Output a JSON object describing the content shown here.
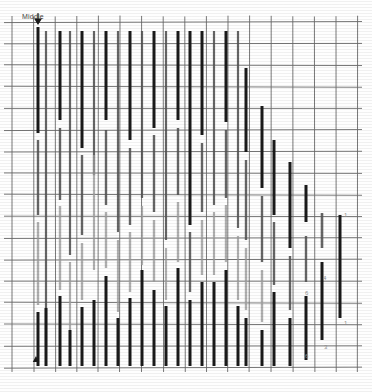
{
  "figure": {
    "title_label": "Middle",
    "arrow_icon": "down-arrow-marker",
    "bottom_marker_icon": "up-triangle-marker",
    "background": "#fefefe",
    "grid_color": "#6e6e6e",
    "grid_minor_color": "#8f8f8f",
    "bar_dark_color": "#1a1a1a",
    "bar_mid_color": "#555555",
    "bar_light_color": "#9a9a9a"
  },
  "chart_data": {
    "type": "bar",
    "title": "Middle",
    "xlabel": "",
    "ylabel": "",
    "grid": true,
    "legend": "none",
    "xlim": [
      0,
      16
    ],
    "ylim": [
      0,
      16
    ],
    "grid_cols": 16,
    "grid_rows": 16,
    "plot_box": {
      "x": 12,
      "y": 22,
      "w": 346,
      "h": 346
    },
    "cell_w": 21.6,
    "cell_h": 21.6,
    "annotations": [
      {
        "text": "Middle",
        "x": 24,
        "y": 18
      },
      {
        "text": "1",
        "x": 344,
        "y": 212
      },
      {
        "text": "4",
        "x": 323,
        "y": 275
      },
      {
        "text": "6",
        "x": 305,
        "y": 290
      },
      {
        "text": "1",
        "x": 344,
        "y": 320
      },
      {
        "text": "3",
        "x": 324,
        "y": 344
      },
      {
        "text": "6",
        "x": 305,
        "y": 353
      }
    ],
    "markers": [
      {
        "icon": "down-arrow-marker",
        "x": 38,
        "y": 20
      },
      {
        "icon": "up-triangle-marker",
        "x": 36,
        "y": 356
      }
    ],
    "series": [
      {
        "name": "dark",
        "color": "#1a1a1a"
      },
      {
        "name": "mid",
        "color": "#555555"
      },
      {
        "name": "light",
        "color": "#9a9a9a"
      }
    ],
    "bars": [
      {
        "x": 38,
        "y0": 27,
        "y1": 133,
        "w": 3.0,
        "tone": "dark"
      },
      {
        "x": 38,
        "y0": 140,
        "y1": 215,
        "w": 2.4,
        "tone": "mid"
      },
      {
        "x": 38,
        "y0": 222,
        "y1": 305,
        "w": 2.4,
        "tone": "light"
      },
      {
        "x": 38,
        "y0": 312,
        "y1": 366,
        "w": 3.0,
        "tone": "dark"
      },
      {
        "x": 46,
        "y0": 31,
        "y1": 346,
        "w": 2.2,
        "tone": "mid"
      },
      {
        "x": 46,
        "y0": 308,
        "y1": 366,
        "w": 3.0,
        "tone": "dark"
      },
      {
        "x": 60,
        "y0": 31,
        "y1": 120,
        "w": 3.0,
        "tone": "dark"
      },
      {
        "x": 60,
        "y0": 128,
        "y1": 200,
        "w": 2.4,
        "tone": "mid"
      },
      {
        "x": 60,
        "y0": 206,
        "y1": 290,
        "w": 2.4,
        "tone": "light"
      },
      {
        "x": 60,
        "y0": 296,
        "y1": 366,
        "w": 3.0,
        "tone": "dark"
      },
      {
        "x": 70,
        "y0": 31,
        "y1": 255,
        "w": 2.2,
        "tone": "mid"
      },
      {
        "x": 70,
        "y0": 262,
        "y1": 330,
        "w": 2.2,
        "tone": "light"
      },
      {
        "x": 70,
        "y0": 330,
        "y1": 366,
        "w": 3.0,
        "tone": "dark"
      },
      {
        "x": 82,
        "y0": 31,
        "y1": 148,
        "w": 3.0,
        "tone": "dark"
      },
      {
        "x": 82,
        "y0": 155,
        "y1": 235,
        "w": 2.4,
        "tone": "mid"
      },
      {
        "x": 82,
        "y0": 243,
        "y1": 300,
        "w": 2.4,
        "tone": "light"
      },
      {
        "x": 82,
        "y0": 307,
        "y1": 366,
        "w": 3.0,
        "tone": "dark"
      },
      {
        "x": 94,
        "y0": 31,
        "y1": 175,
        "w": 2.2,
        "tone": "mid"
      },
      {
        "x": 94,
        "y0": 155,
        "y1": 270,
        "w": 2.2,
        "tone": "light"
      },
      {
        "x": 94,
        "y0": 300,
        "y1": 366,
        "w": 3.0,
        "tone": "dark"
      },
      {
        "x": 106,
        "y0": 31,
        "y1": 120,
        "w": 3.0,
        "tone": "dark"
      },
      {
        "x": 106,
        "y0": 130,
        "y1": 205,
        "w": 2.4,
        "tone": "mid"
      },
      {
        "x": 106,
        "y0": 212,
        "y1": 268,
        "w": 2.4,
        "tone": "light"
      },
      {
        "x": 106,
        "y0": 276,
        "y1": 366,
        "w": 3.0,
        "tone": "dark"
      },
      {
        "x": 118,
        "y0": 31,
        "y1": 232,
        "w": 2.2,
        "tone": "mid"
      },
      {
        "x": 118,
        "y0": 240,
        "y1": 312,
        "w": 2.2,
        "tone": "light"
      },
      {
        "x": 118,
        "y0": 318,
        "y1": 366,
        "w": 3.0,
        "tone": "dark"
      },
      {
        "x": 130,
        "y0": 31,
        "y1": 140,
        "w": 3.0,
        "tone": "dark"
      },
      {
        "x": 130,
        "y0": 148,
        "y1": 225,
        "w": 2.4,
        "tone": "mid"
      },
      {
        "x": 130,
        "y0": 232,
        "y1": 292,
        "w": 2.4,
        "tone": "light"
      },
      {
        "x": 130,
        "y0": 298,
        "y1": 366,
        "w": 3.0,
        "tone": "dark"
      },
      {
        "x": 142,
        "y0": 31,
        "y1": 198,
        "w": 2.2,
        "tone": "mid"
      },
      {
        "x": 142,
        "y0": 206,
        "y1": 265,
        "w": 2.2,
        "tone": "light"
      },
      {
        "x": 142,
        "y0": 270,
        "y1": 366,
        "w": 3.0,
        "tone": "dark"
      },
      {
        "x": 154,
        "y0": 31,
        "y1": 128,
        "w": 3.0,
        "tone": "dark"
      },
      {
        "x": 154,
        "y0": 135,
        "y1": 212,
        "w": 2.4,
        "tone": "mid"
      },
      {
        "x": 154,
        "y0": 220,
        "y1": 282,
        "w": 2.4,
        "tone": "light"
      },
      {
        "x": 154,
        "y0": 290,
        "y1": 366,
        "w": 3.0,
        "tone": "dark"
      },
      {
        "x": 166,
        "y0": 31,
        "y1": 240,
        "w": 2.2,
        "tone": "mid"
      },
      {
        "x": 166,
        "y0": 248,
        "y1": 300,
        "w": 2.2,
        "tone": "light"
      },
      {
        "x": 166,
        "y0": 306,
        "y1": 366,
        "w": 3.0,
        "tone": "dark"
      },
      {
        "x": 178,
        "y0": 31,
        "y1": 120,
        "w": 3.0,
        "tone": "dark"
      },
      {
        "x": 178,
        "y0": 128,
        "y1": 195,
        "w": 2.4,
        "tone": "mid"
      },
      {
        "x": 178,
        "y0": 202,
        "y1": 262,
        "w": 2.4,
        "tone": "light"
      },
      {
        "x": 178,
        "y0": 268,
        "y1": 366,
        "w": 3.0,
        "tone": "dark"
      },
      {
        "x": 190,
        "y0": 31,
        "y1": 225,
        "w": 3.0,
        "tone": "dark"
      },
      {
        "x": 190,
        "y0": 232,
        "y1": 292,
        "w": 2.4,
        "tone": "mid"
      },
      {
        "x": 190,
        "y0": 300,
        "y1": 366,
        "w": 3.0,
        "tone": "dark"
      },
      {
        "x": 202,
        "y0": 31,
        "y1": 135,
        "w": 3.0,
        "tone": "dark"
      },
      {
        "x": 202,
        "y0": 143,
        "y1": 212,
        "w": 2.4,
        "tone": "mid"
      },
      {
        "x": 202,
        "y0": 220,
        "y1": 275,
        "w": 2.4,
        "tone": "light"
      },
      {
        "x": 202,
        "y0": 282,
        "y1": 366,
        "w": 3.0,
        "tone": "dark"
      },
      {
        "x": 214,
        "y0": 31,
        "y1": 205,
        "w": 2.2,
        "tone": "mid"
      },
      {
        "x": 214,
        "y0": 212,
        "y1": 275,
        "w": 2.2,
        "tone": "light"
      },
      {
        "x": 214,
        "y0": 282,
        "y1": 366,
        "w": 3.0,
        "tone": "dark"
      },
      {
        "x": 226,
        "y0": 31,
        "y1": 122,
        "w": 3.0,
        "tone": "dark"
      },
      {
        "x": 226,
        "y0": 130,
        "y1": 198,
        "w": 2.4,
        "tone": "mid"
      },
      {
        "x": 226,
        "y0": 205,
        "y1": 262,
        "w": 2.4,
        "tone": "light"
      },
      {
        "x": 226,
        "y0": 270,
        "y1": 366,
        "w": 3.0,
        "tone": "dark"
      },
      {
        "x": 238,
        "y0": 31,
        "y1": 228,
        "w": 2.2,
        "tone": "mid"
      },
      {
        "x": 238,
        "y0": 236,
        "y1": 300,
        "w": 2.2,
        "tone": "light"
      },
      {
        "x": 238,
        "y0": 306,
        "y1": 366,
        "w": 3.0,
        "tone": "dark"
      },
      {
        "x": 246,
        "y0": 68,
        "y1": 152,
        "w": 3.0,
        "tone": "dark"
      },
      {
        "x": 246,
        "y0": 160,
        "y1": 240,
        "w": 2.4,
        "tone": "mid"
      },
      {
        "x": 246,
        "y0": 248,
        "y1": 310,
        "w": 2.4,
        "tone": "light"
      },
      {
        "x": 246,
        "y0": 318,
        "y1": 366,
        "w": 3.0,
        "tone": "dark"
      },
      {
        "x": 262,
        "y0": 106,
        "y1": 188,
        "w": 3.0,
        "tone": "dark"
      },
      {
        "x": 262,
        "y0": 196,
        "y1": 262,
        "w": 2.4,
        "tone": "mid"
      },
      {
        "x": 262,
        "y0": 270,
        "y1": 322,
        "w": 2.4,
        "tone": "light"
      },
      {
        "x": 262,
        "y0": 330,
        "y1": 366,
        "w": 3.0,
        "tone": "dark"
      },
      {
        "x": 274,
        "y0": 140,
        "y1": 215,
        "w": 3.0,
        "tone": "dark"
      },
      {
        "x": 274,
        "y0": 222,
        "y1": 285,
        "w": 2.4,
        "tone": "mid"
      },
      {
        "x": 274,
        "y0": 292,
        "y1": 366,
        "w": 3.0,
        "tone": "dark"
      },
      {
        "x": 290,
        "y0": 162,
        "y1": 248,
        "w": 3.0,
        "tone": "dark"
      },
      {
        "x": 290,
        "y0": 256,
        "y1": 310,
        "w": 2.4,
        "tone": "mid"
      },
      {
        "x": 290,
        "y0": 318,
        "y1": 366,
        "w": 3.0,
        "tone": "dark"
      },
      {
        "x": 306,
        "y0": 185,
        "y1": 222,
        "w": 3.0,
        "tone": "dark"
      },
      {
        "x": 306,
        "y0": 236,
        "y1": 282,
        "w": 2.4,
        "tone": "mid"
      },
      {
        "x": 306,
        "y0": 296,
        "y1": 360,
        "w": 3.0,
        "tone": "dark"
      },
      {
        "x": 322,
        "y0": 213,
        "y1": 248,
        "w": 2.6,
        "tone": "mid"
      },
      {
        "x": 322,
        "y0": 262,
        "y1": 340,
        "w": 3.0,
        "tone": "dark"
      },
      {
        "x": 340,
        "y0": 215,
        "y1": 318,
        "w": 3.0,
        "tone": "dark"
      }
    ]
  }
}
